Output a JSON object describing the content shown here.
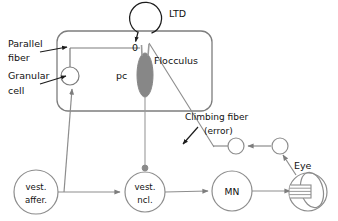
{
  "figure": {
    "colors": {
      "stroke": "#7d7d7d",
      "stroke_dark": "#6a6a6a",
      "text": "#111111",
      "purkinje_fill": "#878787",
      "terminal_fill": "#8a8a8a",
      "background": "#ffffff"
    }
  },
  "labels": {
    "ltd": "LTD",
    "parallel_fiber_line1": "Parallel",
    "parallel_fiber_line2": "fiber",
    "granular_cell_line1": "Granular",
    "granular_cell_line2": "cell",
    "zero": "0",
    "pc": "pc",
    "flocculus": "Flocculus",
    "climbing_fiber_line1": "Climbing fiber",
    "climbing_fiber_line2": "(error)",
    "eye": "Eye"
  },
  "nodes": [
    {
      "id": "granular-cell",
      "shape": "circle",
      "label": "",
      "cx": 70,
      "cy": 76,
      "r": 9
    },
    {
      "id": "purkinje-cell",
      "shape": "ellipse",
      "label": "pc",
      "cx": 145,
      "cy": 75,
      "rx": 8,
      "ry": 22
    },
    {
      "id": "ltd-loop",
      "shape": "circle",
      "label": "LTD",
      "cx": 145,
      "cy": 18,
      "r": 16
    },
    {
      "id": "feedback-left",
      "shape": "circle",
      "label": "",
      "cx": 236,
      "cy": 146,
      "r": 8
    },
    {
      "id": "feedback-right",
      "shape": "circle",
      "label": "",
      "cx": 280,
      "cy": 146,
      "r": 8
    },
    {
      "id": "vest-affer",
      "shape": "circle",
      "label_line1": "vest.",
      "label_line2": "affer.",
      "cx": 36,
      "cy": 192,
      "r": 22
    },
    {
      "id": "vest-ncl",
      "shape": "circle",
      "label_line1": "vest.",
      "label_line2": "ncl.",
      "cx": 145,
      "cy": 192,
      "r": 20
    },
    {
      "id": "motor-neuron",
      "shape": "circle",
      "label": "MN",
      "cx": 232,
      "cy": 191,
      "r": 20
    },
    {
      "id": "eye",
      "shape": "eyeball",
      "label": "Eye",
      "cx": 308,
      "cy": 192,
      "r": 19
    }
  ],
  "box": {
    "id": "flocculus-box",
    "x": 57,
    "y": 31,
    "width": 155,
    "height": 80,
    "rx": 11
  }
}
